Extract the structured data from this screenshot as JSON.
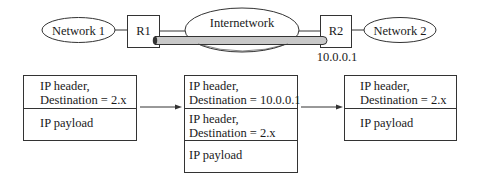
{
  "topology": {
    "network1": "Network 1",
    "router1": "R1",
    "internetwork": "Internetwork",
    "router2": "R2",
    "router2_address": "10.0.0.1",
    "network2": "Network 2"
  },
  "packets": [
    {
      "name": "original",
      "segments": [
        {
          "lines": [
            "IP header,",
            "Destination = 2.x"
          ]
        },
        {
          "lines": [
            "IP payload"
          ]
        }
      ]
    },
    {
      "name": "encapsulated",
      "segments": [
        {
          "lines": [
            "IP header,",
            "Destination = 10.0.0.1"
          ]
        },
        {
          "lines": [
            "IP header,",
            "Destination = 2.x"
          ]
        },
        {
          "lines": [
            "IP payload"
          ]
        }
      ]
    },
    {
      "name": "decapsulated",
      "segments": [
        {
          "lines": [
            "IP header,",
            "Destination = 2.x"
          ]
        },
        {
          "lines": [
            "IP payload"
          ]
        }
      ]
    }
  ],
  "colors": {
    "stroke": "#333333",
    "tunnel_fill": "#c8c8c8"
  }
}
